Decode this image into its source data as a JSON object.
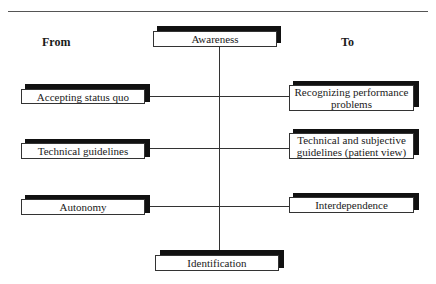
{
  "headers": {
    "from": "From",
    "to": "To"
  },
  "center": {
    "top": "Awareness",
    "bottom": "Identification"
  },
  "rows": [
    {
      "from": "Accepting status quo",
      "to": "Recognizing performance problems"
    },
    {
      "from": "Technical guidelines",
      "to": "Technical and subjective guidelines (patient view)"
    },
    {
      "from": "Autonomy",
      "to": "Interdependence"
    }
  ],
  "colors": {
    "line": "#333333",
    "shadow": "#111111",
    "box": "#ffffff"
  }
}
